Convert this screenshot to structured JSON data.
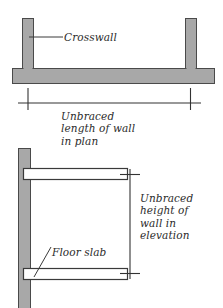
{
  "diagram": {
    "background_color": "#ffffff",
    "wall_fill_color": "#a8a8a8",
    "wall_stroke_color": "#4a4a4a",
    "slab_fill_color": "#ffffff",
    "slab_stroke_color": "#3a3a3a",
    "dimension_line_color": "#333333",
    "text_color": "#2b2b2b"
  },
  "plan_view": {
    "name": "plan",
    "label_crosswall": "Crosswall",
    "caption_lines": [
      "Unbraced",
      "length of wall",
      "in plan"
    ],
    "dimension_name": "unbraced-length"
  },
  "elevation_view": {
    "name": "elevation",
    "label_floor_slab": "Floor slab",
    "caption_lines": [
      "Unbraced",
      "height of",
      "wall in",
      "elevation"
    ],
    "dimension_name": "unbraced-height"
  }
}
